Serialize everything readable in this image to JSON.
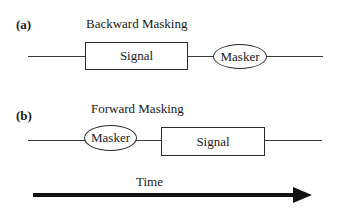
{
  "diagram": {
    "type": "timing-diagram",
    "panels": [
      {
        "id": "(a)",
        "title": "Backward Masking",
        "sequence": [
          {
            "kind": "rectangle",
            "label": "Signal"
          },
          {
            "kind": "ellipse",
            "label": "Masker"
          }
        ]
      },
      {
        "id": "(b)",
        "title": "Forward Masking",
        "sequence": [
          {
            "kind": "ellipse",
            "label": "Masker"
          },
          {
            "kind": "rectangle",
            "label": "Signal"
          }
        ]
      }
    ],
    "time_axis": {
      "label": "Time",
      "direction": "left-to-right"
    },
    "colors": {
      "line": "#3a3a3a",
      "arrow": "#111111",
      "text": "#1a1a1a",
      "background": "#ffffff"
    }
  }
}
